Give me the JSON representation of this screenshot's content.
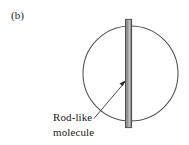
{
  "figure": {
    "panel_label": "(b)",
    "annotation": {
      "line1": "Rod-like",
      "line2": "molecule"
    },
    "colors": {
      "background": "#ffffff",
      "circle_stroke": "#4d4d4d",
      "rod_fill": "#8f8f8f",
      "rod_edge_dark": "#4a4a4a",
      "rod_highlight": "#c9c9c9",
      "leader_line": "#333333",
      "text": "#1a1a1a"
    },
    "shapes": {
      "circle": {
        "name": "sphere-outline",
        "cx": 130.5,
        "cy": 73.5,
        "r": 47.5
      },
      "rod": {
        "name": "rod-like-molecule",
        "x": 125,
        "y": 19,
        "width": 7,
        "height": 109
      },
      "leader": {
        "name": "annotation-leader-arrow",
        "x1": 94,
        "y1": 118,
        "x2": 126,
        "y2": 81
      }
    }
  }
}
